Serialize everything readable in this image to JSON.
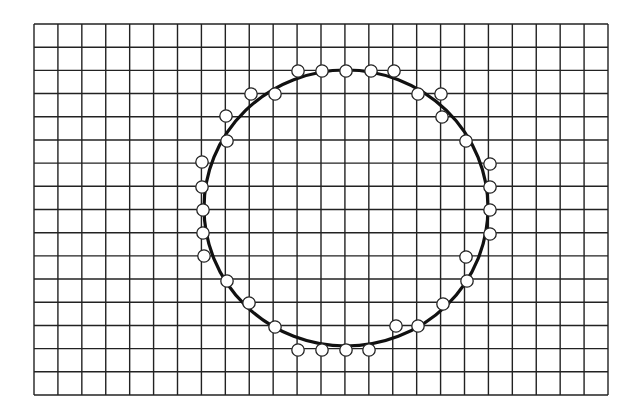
{
  "figure": {
    "background": "#ffffff",
    "line_color": "#222222",
    "grid": {
      "left": 34,
      "top": 24,
      "right": 608,
      "bottom": 395,
      "columns": 24,
      "rows": 16,
      "stroke_width": 1.4
    },
    "circle": {
      "cx": 346,
      "cy": 208,
      "rx": 142,
      "ry": 138,
      "stroke_width": 3.2
    },
    "marker": {
      "radius": 6.2,
      "fill": "#ffffff",
      "stroke_width": 1.3
    },
    "points": [
      [
        298,
        71
      ],
      [
        322,
        71
      ],
      [
        346,
        71
      ],
      [
        371,
        71
      ],
      [
        394,
        71
      ],
      [
        251,
        94
      ],
      [
        275,
        94
      ],
      [
        418,
        94
      ],
      [
        441,
        94
      ],
      [
        226,
        116
      ],
      [
        442,
        117
      ],
      [
        227,
        141
      ],
      [
        466,
        141
      ],
      [
        202,
        162
      ],
      [
        490,
        164
      ],
      [
        202,
        187
      ],
      [
        490,
        187
      ],
      [
        203,
        210
      ],
      [
        490,
        210
      ],
      [
        203,
        233
      ],
      [
        490,
        234
      ],
      [
        204,
        256
      ],
      [
        466,
        257
      ],
      [
        227,
        281
      ],
      [
        467,
        281
      ],
      [
        249,
        303
      ],
      [
        443,
        304
      ],
      [
        275,
        327
      ],
      [
        396,
        326
      ],
      [
        418,
        326
      ],
      [
        298,
        350
      ],
      [
        322,
        350
      ],
      [
        346,
        350
      ],
      [
        369,
        350
      ]
    ]
  }
}
